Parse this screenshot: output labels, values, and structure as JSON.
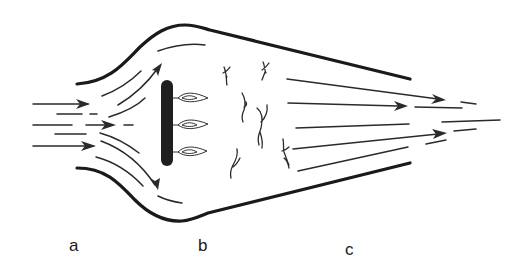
{
  "diagram": {
    "colors": {
      "line": "#1a1a1a",
      "background": "#ffffff"
    },
    "regions": [
      {
        "id": "a",
        "label": "a",
        "description": "inlet / diffuser with incoming flow arrows"
      },
      {
        "id": "b",
        "label": "b",
        "description": "flame holder with flames and turbulent combustion zone"
      },
      {
        "id": "c",
        "label": "c",
        "description": "converging nozzle with accelerating exhaust flow"
      }
    ],
    "elements": {
      "flame_holder": "vertical bar",
      "flame_count": 3,
      "inlet_arrows": 3,
      "exhaust_arrows": 3
    }
  }
}
